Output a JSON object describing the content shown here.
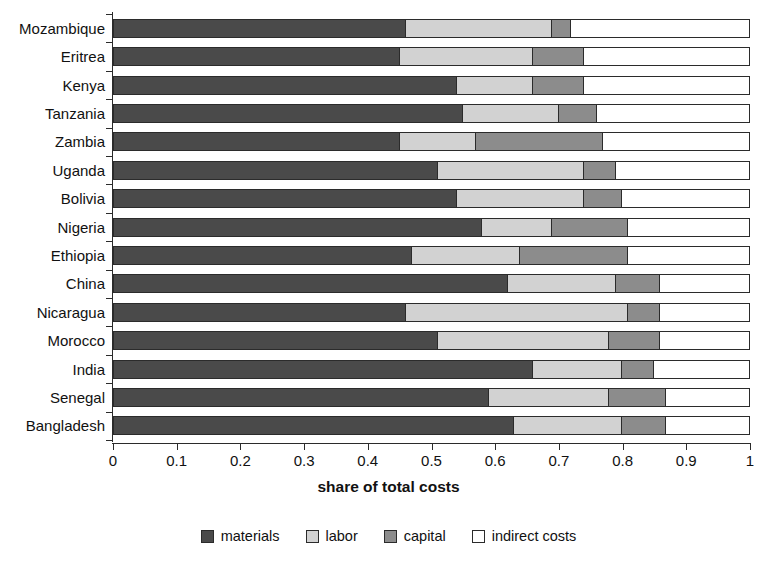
{
  "chart_data": {
    "type": "bar",
    "orientation": "horizontal",
    "stacked": true,
    "title": "",
    "xlabel": "share of total costs",
    "ylabel": "",
    "xlim": [
      0,
      1
    ],
    "grid": false,
    "legend_position": "bottom",
    "xticks": [
      "0",
      "0.1",
      "0.2",
      "0.3",
      "0.4",
      "0.5",
      "0.6",
      "0.7",
      "0.8",
      "0.9",
      "1"
    ],
    "xtick_values": [
      0,
      0.1,
      0.2,
      0.3,
      0.4,
      0.5,
      0.6,
      0.7,
      0.8,
      0.9,
      1
    ],
    "categories": [
      "Mozambique",
      "Eritrea",
      "Kenya",
      "Tanzania",
      "Zambia",
      "Uganda",
      "Bolivia",
      "Nigeria",
      "Ethiopia",
      "China",
      "Nicaragua",
      "Morocco",
      "India",
      "Senegal",
      "Bangladesh"
    ],
    "series": [
      {
        "name": "materials",
        "color": "#4a4a4a",
        "values": [
          0.46,
          0.45,
          0.54,
          0.55,
          0.45,
          0.51,
          0.54,
          0.58,
          0.47,
          0.62,
          0.46,
          0.51,
          0.66,
          0.59,
          0.63
        ]
      },
      {
        "name": "labor",
        "color": "#d2d2d2",
        "values": [
          0.23,
          0.21,
          0.12,
          0.15,
          0.12,
          0.23,
          0.2,
          0.11,
          0.17,
          0.17,
          0.35,
          0.27,
          0.14,
          0.19,
          0.17
        ]
      },
      {
        "name": "capital",
        "color": "#8c8c8c",
        "values": [
          0.03,
          0.08,
          0.08,
          0.06,
          0.2,
          0.05,
          0.06,
          0.12,
          0.17,
          0.07,
          0.05,
          0.08,
          0.05,
          0.09,
          0.07
        ]
      },
      {
        "name": "indirect costs",
        "color": "#ffffff",
        "values": [
          0.28,
          0.26,
          0.26,
          0.24,
          0.23,
          0.21,
          0.2,
          0.19,
          0.19,
          0.14,
          0.14,
          0.14,
          0.15,
          0.13,
          0.13
        ]
      }
    ],
    "cumulative_boundaries": [
      [
        0.46,
        0.69,
        0.72
      ],
      [
        0.45,
        0.66,
        0.74
      ],
      [
        0.54,
        0.66,
        0.74
      ],
      [
        0.55,
        0.7,
        0.76
      ],
      [
        0.45,
        0.57,
        0.77
      ],
      [
        0.51,
        0.74,
        0.79
      ],
      [
        0.54,
        0.74,
        0.8
      ],
      [
        0.58,
        0.69,
        0.81
      ],
      [
        0.47,
        0.64,
        0.81
      ],
      [
        0.62,
        0.79,
        0.86
      ],
      [
        0.46,
        0.81,
        0.86
      ],
      [
        0.51,
        0.78,
        0.86
      ],
      [
        0.66,
        0.8,
        0.85
      ],
      [
        0.59,
        0.78,
        0.87
      ],
      [
        0.63,
        0.8,
        0.87
      ]
    ]
  },
  "legend": {
    "items": [
      {
        "label": "materials"
      },
      {
        "label": "labor"
      },
      {
        "label": "capital"
      },
      {
        "label": "indirect costs"
      }
    ]
  }
}
